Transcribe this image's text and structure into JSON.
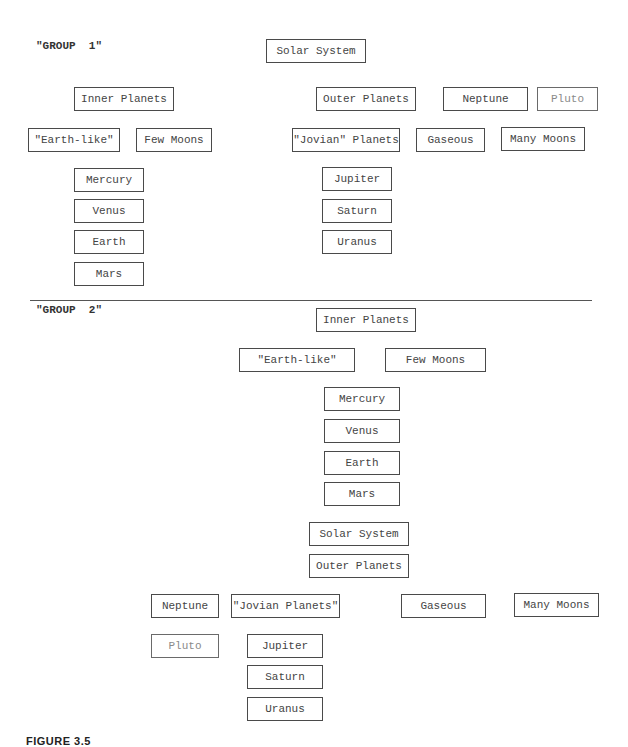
{
  "group1": {
    "label": "\"GROUP  1\"",
    "root": "Solar System",
    "inner": "Inner Planets",
    "inner_attrs": [
      "\"Earth-like\"",
      "Few Moons"
    ],
    "inner_members": [
      "Mercury",
      "Venus",
      "Earth",
      "Mars"
    ],
    "outer": "Outer Planets",
    "outer_extras": [
      "Neptune",
      "Pluto"
    ],
    "outer_attrs": [
      "\"Jovian\" Planets",
      "Gaseous",
      "Many Moons"
    ],
    "outer_members": [
      "Jupiter",
      "Saturn",
      "Uranus"
    ]
  },
  "group2": {
    "label": "\"GROUP  2\"",
    "inner": "Inner Planets",
    "inner_attrs": [
      "\"Earth-like\"",
      "Few Moons"
    ],
    "inner_members": [
      "Mercury",
      "Venus",
      "Earth",
      "Mars"
    ],
    "root": "Solar System",
    "outer": "Outer Planets",
    "outer_row": [
      "Neptune",
      "\"Jovian Planets\"",
      "Gaseous",
      "Many Moons"
    ],
    "pluto": "Pluto",
    "outer_members": [
      "Jupiter",
      "Saturn",
      "Uranus"
    ]
  },
  "caption": "FIGURE 3.5"
}
